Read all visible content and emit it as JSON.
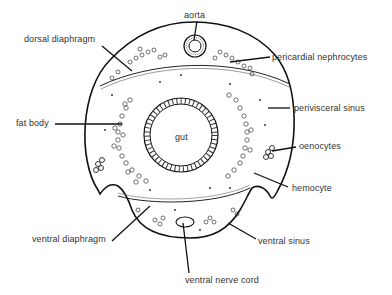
{
  "diagram": {
    "colors": {
      "stroke": "#111111",
      "text": "#333333",
      "background": "#ffffff"
    },
    "labels": {
      "aorta": "aorta",
      "dorsal_diaphragm": "dorsal diaphragm",
      "pericardial_nephrocytes": "pericardial nephrocytes",
      "perivisceral_sinus": "perivisceral sinus",
      "fat_body": "fat body",
      "gut": "gut",
      "oenocytes": "oenocytes",
      "hemocyte": "hemocyte",
      "ventral_diaphragm": "ventral diaphragm",
      "ventral_sinus": "ventral sinus",
      "ventral_nerve_cord": "ventral nerve cord"
    }
  }
}
